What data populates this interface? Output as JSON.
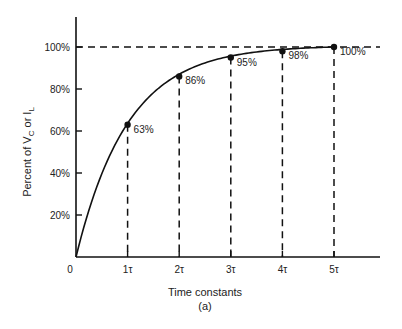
{
  "chart_data": {
    "type": "line",
    "title": "",
    "xlabel": "Time constants",
    "ylabel": "Percent of V_C or I_L",
    "ylabel_parts": {
      "main": "Percent of V",
      "sub1": "C",
      "mid": " or I",
      "sub2": "L"
    },
    "caption": "(a)",
    "x_ticks": [
      "0",
      "1τ",
      "2τ",
      "3τ",
      "4τ",
      "5τ"
    ],
    "y_ticks": [
      "20%",
      "40%",
      "60%",
      "80%",
      "100%"
    ],
    "x": [
      0,
      1,
      2,
      3,
      4,
      5
    ],
    "values": [
      0,
      63,
      86,
      95,
      98,
      100
    ],
    "point_labels": [
      "63%",
      "86%",
      "95%",
      "98%",
      "100%"
    ],
    "ylim": [
      0,
      100
    ],
    "xlim": [
      0,
      5.9
    ],
    "reference_line": {
      "y": 100,
      "style": "dashed"
    },
    "drop_lines": {
      "style": "dashed",
      "at_x": [
        1,
        2,
        3,
        4,
        5
      ]
    },
    "grid": false,
    "legend": null
  }
}
